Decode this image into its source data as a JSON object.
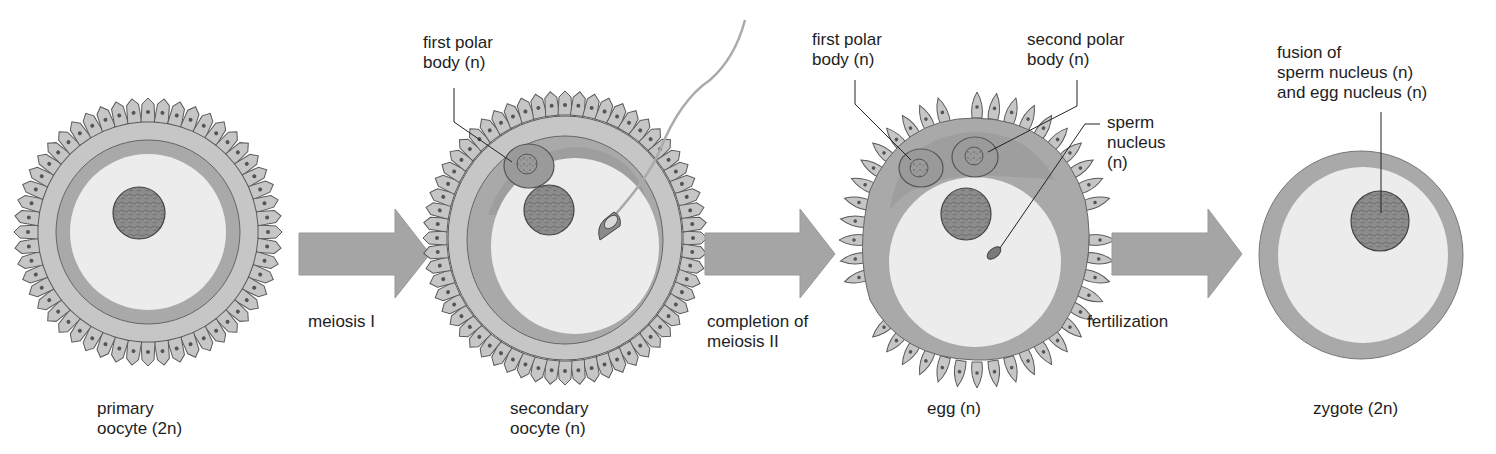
{
  "diagram": {
    "stages": [
      {
        "id": "primary-oocyte",
        "label_line1": "primary",
        "label_line2": "oocyte (2n)"
      },
      {
        "id": "secondary-oocyte",
        "label_line1": "secondary",
        "label_line2": "oocyte (n)"
      },
      {
        "id": "egg",
        "label_line1": "egg (n)"
      },
      {
        "id": "zygote",
        "label_line1": "zygote (2n)"
      }
    ],
    "transitions": [
      {
        "id": "meiosis-1",
        "label_line1": "meiosis I"
      },
      {
        "id": "meiosis-2",
        "label_line1": "completion of",
        "label_line2": "meiosis II"
      },
      {
        "id": "fertilization",
        "label_line1": "fertilization"
      }
    ],
    "callouts": {
      "secondary_first_polar": {
        "line1": "first polar",
        "line2": "body (n)"
      },
      "egg_first_polar": {
        "line1": "first polar",
        "line2": "body (n)"
      },
      "egg_second_polar": {
        "line1": "second polar",
        "line2": "body (n)"
      },
      "egg_sperm_nucleus": {
        "line1": "sperm",
        "line2": "nucleus",
        "line3": "(n)"
      },
      "zygote_fusion": {
        "line1": "fusion of",
        "line2": "sperm nucleus (n)",
        "line3": "and egg nucleus (n)"
      }
    },
    "colors": {
      "background": "#ffffff",
      "follicle_cell": "#c4c4c4",
      "zona_pellucida": "#a8a8a8",
      "cytoplasm": "#ebebeb",
      "nucleus": "#8a8a8a",
      "arrow": "#a3a3a3",
      "outline": "#555555"
    }
  }
}
